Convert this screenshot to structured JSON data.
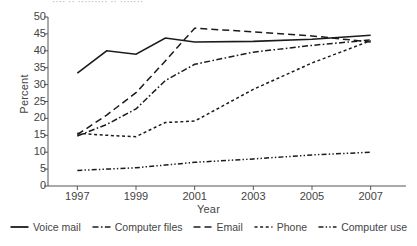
{
  "title_cut": "···· ·· ········· ·· ·······",
  "axes": {
    "ylabel": "Percent",
    "xlabel": "Year",
    "yticks": [
      0,
      5,
      10,
      15,
      20,
      25,
      30,
      35,
      40,
      45,
      50
    ],
    "xticks": [
      1997,
      1999,
      2001,
      2003,
      2005,
      2007
    ]
  },
  "legend": [
    {
      "label": "Voice mail",
      "dash": "solid"
    },
    {
      "label": "Computer files",
      "dash": "dashdot"
    },
    {
      "label": "Email",
      "dash": "dashed"
    },
    {
      "label": "Phone",
      "dash": "dotted"
    },
    {
      "label": "Computer use",
      "dash": "dashdotdot"
    }
  ],
  "chart_data": {
    "type": "line",
    "title": "",
    "xlabel": "Year",
    "ylabel": "Percent",
    "xlim": [
      1996,
      2008
    ],
    "ylim": [
      0,
      50
    ],
    "grid": false,
    "legend_position": "bottom",
    "x": [
      1996,
      1997,
      1998,
      1999,
      2000,
      2001,
      2002,
      2003,
      2004,
      2005,
      2006,
      2007,
      2008
    ],
    "series": [
      {
        "name": "Voice mail",
        "style": "solid",
        "x": [
          1997,
          1998,
          1999,
          2000,
          2001,
          2003,
          2005,
          2007
        ],
        "values": [
          33.4,
          40.0,
          39.0,
          43.8,
          42.6,
          42.8,
          43.4,
          44.6
        ]
      },
      {
        "name": "Computer files",
        "style": "dashdot",
        "x": [
          1997,
          1998,
          1999,
          2000,
          2001,
          2003,
          2005,
          2007
        ],
        "values": [
          14.8,
          18.2,
          22.8,
          31.2,
          36.0,
          39.6,
          41.6,
          43.2
        ]
      },
      {
        "name": "Email",
        "style": "dashed",
        "x": [
          1997,
          1998,
          1999,
          2000,
          2001,
          2003,
          2005,
          2007
        ],
        "values": [
          15.2,
          21.0,
          27.6,
          37.0,
          46.7,
          45.6,
          44.4,
          42.6
        ]
      },
      {
        "name": "Phone",
        "style": "dotted",
        "x": [
          1997,
          1998,
          1999,
          2000,
          2001,
          2003,
          2005,
          2007
        ],
        "values": [
          15.6,
          15.0,
          14.6,
          18.8,
          19.2,
          28.6,
          36.4,
          43.0
        ]
      },
      {
        "name": "Computer use",
        "style": "dashdotdot",
        "x": [
          1997,
          1998,
          1999,
          2000,
          2001,
          2003,
          2005,
          2007
        ],
        "values": [
          4.6,
          5.0,
          5.4,
          6.2,
          7.0,
          8.0,
          9.2,
          10.0
        ]
      }
    ]
  }
}
